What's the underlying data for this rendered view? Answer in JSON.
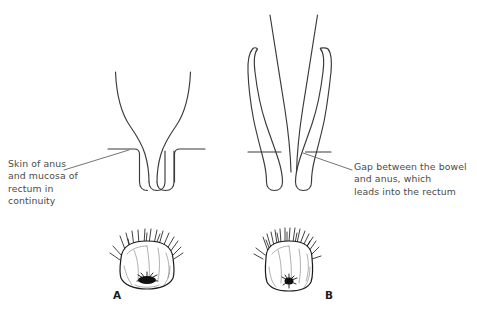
{
  "figure": {
    "type": "medical-diagram",
    "background_color": "#ffffff",
    "line_color": "#3a3a3a",
    "text_color": "#4a4a4a",
    "panels": [
      {
        "id": "A",
        "letter": "A",
        "description": "Cross-section showing normal anal canal where skin of anus and mucosa of rectum are continuous"
      },
      {
        "id": "B",
        "letter": "B",
        "description": "Cross-section showing imperforate anus with a gap between the bowel and anus"
      }
    ]
  },
  "annotations": {
    "left": {
      "name": "skin-of-anus-label",
      "lines": [
        "Skin of anus",
        "and mucosa of",
        "rectum in",
        "continuity"
      ],
      "text": "Skin of anus\nand mucosa of\nrectum in\ncontinuity",
      "leader_from": [
        65,
        170
      ],
      "leader_to": [
        129,
        150
      ]
    },
    "right": {
      "name": "gap-between-bowel-label",
      "lines": [
        "Gap between the bowel",
        "and anus, which",
        "leads into the rectum"
      ],
      "text": "Gap between the bowel\nand anus, which\nleads into the rectum",
      "leader_from": [
        352,
        170
      ],
      "leader_to": [
        303,
        153
      ]
    }
  },
  "letters": {
    "a": "A",
    "b": "B"
  }
}
